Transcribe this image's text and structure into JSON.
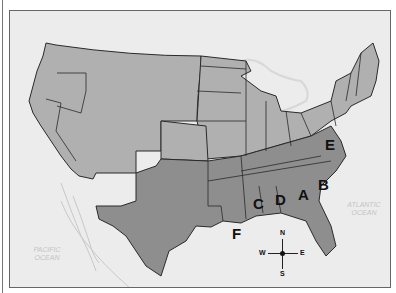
{
  "map": {
    "title": "",
    "colors": {
      "background": "#ececec",
      "union": "#b0b0b0",
      "confederate": "#8e8e8e",
      "border": "#2a2a2a",
      "water_line": "#c8c8c8"
    },
    "state_labels": [
      {
        "id": "A",
        "text": "A"
      },
      {
        "id": "B",
        "text": "B"
      },
      {
        "id": "C",
        "text": "C"
      },
      {
        "id": "D",
        "text": "D"
      },
      {
        "id": "E",
        "text": "E"
      },
      {
        "id": "F",
        "text": "F"
      }
    ],
    "oceans": {
      "pacific": {
        "line1": "PACIFIC",
        "line2": "OCEAN"
      },
      "atlantic": {
        "line1": "ATLANTIC",
        "line2": "OCEAN"
      }
    },
    "compass": {
      "n": "N",
      "s": "S",
      "e": "E",
      "w": "W"
    }
  }
}
